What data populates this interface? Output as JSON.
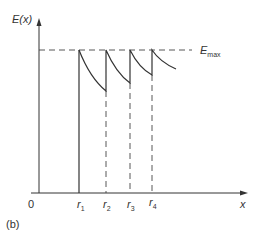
{
  "figure": {
    "panel_label": "(b)",
    "y_axis_label": "E(x)",
    "x_axis_label": "x",
    "origin_label": "0",
    "max_line_label_main": "E",
    "max_line_label_sub": "max",
    "tick_labels": [
      {
        "main": "r",
        "sub": "1"
      },
      {
        "main": "r",
        "sub": "2"
      },
      {
        "main": "r",
        "sub": "3"
      },
      {
        "main": "r",
        "sub": "4"
      }
    ]
  },
  "colors": {
    "ink": "#333333",
    "background": "#ffffff"
  }
}
